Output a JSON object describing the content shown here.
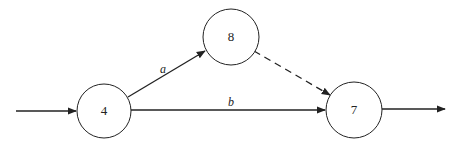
{
  "diagram": {
    "type": "activity-network",
    "nodes": [
      {
        "id": "n4",
        "label": "4",
        "cx": 104,
        "cy": 111,
        "r": 27
      },
      {
        "id": "n8",
        "label": "8",
        "cx": 231,
        "cy": 37,
        "r": 28
      },
      {
        "id": "n7",
        "label": "7",
        "cx": 354,
        "cy": 110,
        "r": 28
      }
    ],
    "edges": [
      {
        "id": "in",
        "from": "start",
        "to": "n4",
        "label": "",
        "style": "solid"
      },
      {
        "id": "a",
        "from": "n4",
        "to": "n8",
        "label": "a",
        "style": "solid"
      },
      {
        "id": "b",
        "from": "n4",
        "to": "n7",
        "label": "b",
        "style": "solid"
      },
      {
        "id": "dummy",
        "from": "n8",
        "to": "n7",
        "label": "",
        "style": "dashed"
      },
      {
        "id": "out",
        "from": "n7",
        "to": "end",
        "label": "",
        "style": "solid"
      }
    ],
    "colors": {
      "stroke": "#222222",
      "background": "#ffffff"
    }
  }
}
